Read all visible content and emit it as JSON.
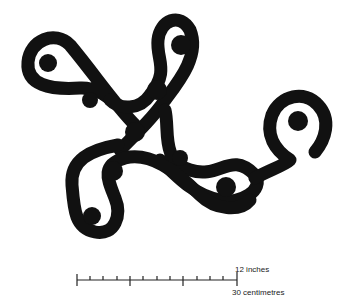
{
  "figure": {
    "ink_color": "#111111",
    "background": "#ffffff",
    "cup_marks": [
      {
        "cx": 48,
        "cy": 63,
        "r": 9
      },
      {
        "cx": 181,
        "cy": 45,
        "r": 10
      },
      {
        "cx": 90,
        "cy": 100,
        "r": 8
      },
      {
        "cx": 157,
        "cy": 90,
        "r": 10
      },
      {
        "cx": 135,
        "cy": 132,
        "r": 10
      },
      {
        "cx": 180,
        "cy": 158,
        "r": 8
      },
      {
        "cx": 113,
        "cy": 171,
        "r": 10
      },
      {
        "cx": 226,
        "cy": 187,
        "r": 10
      },
      {
        "cx": 298,
        "cy": 121,
        "r": 10
      },
      {
        "cx": 92,
        "cy": 216,
        "r": 9
      }
    ]
  },
  "scale_bar": {
    "imperial_label": "12 inches",
    "metric_label": "30 centimetres"
  }
}
